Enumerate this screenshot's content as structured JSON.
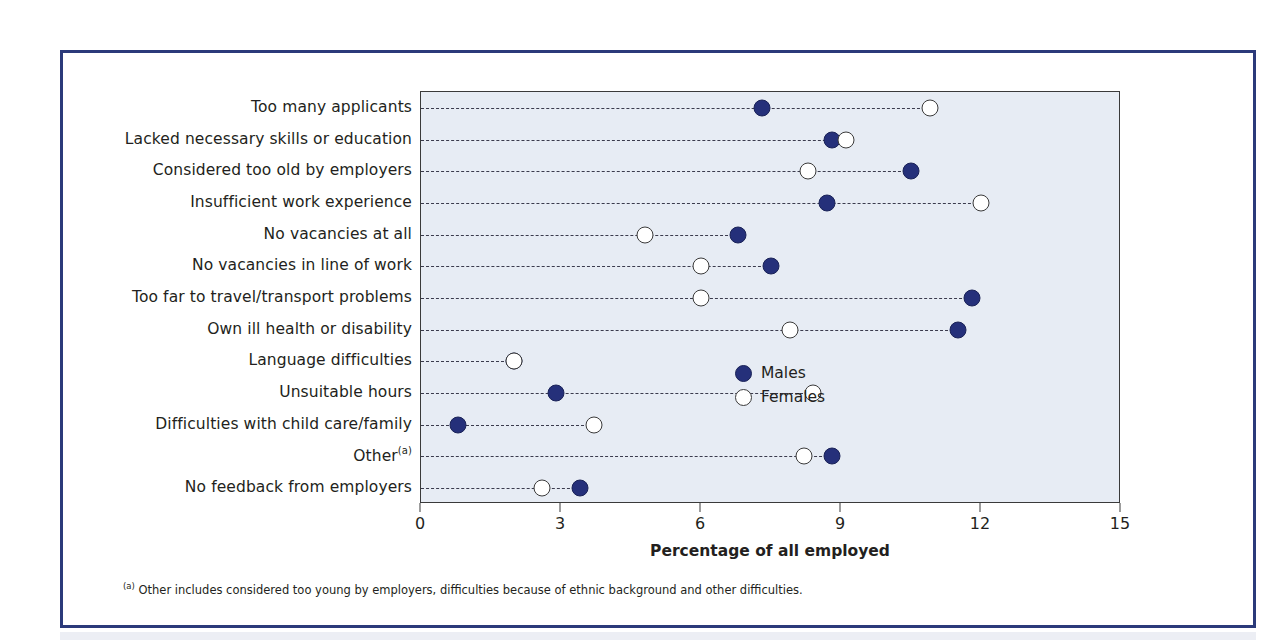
{
  "chart_data": {
    "type": "scatter",
    "title": "",
    "xlabel": "Percentage of all employed",
    "ylabel": "",
    "xlim": [
      0,
      15
    ],
    "xticks": [
      "0",
      "3",
      "6",
      "9",
      "12",
      "15"
    ],
    "grid": false,
    "legend_position": "inside-right",
    "categories": [
      "Too many applicants",
      "Lacked necessary skills or education",
      "Considered too old by employers",
      "Insufficient work experience",
      "No vacancies at all",
      "No vacancies in line of work",
      "Too far to travel/transport problems",
      "Own ill health or disability",
      "Language difficulties",
      "Unsuitable hours",
      "Difficulties with child care/family",
      "Other",
      "No feedback from employers"
    ],
    "category_footnote_marks": [
      "",
      "",
      "",
      "",
      "",
      "",
      "",
      "",
      "",
      "",
      "",
      "(a)",
      ""
    ],
    "series": [
      {
        "name": "Males",
        "color": "#25307a",
        "marker": "filled-circle",
        "values": [
          7.3,
          8.8,
          10.5,
          8.7,
          6.8,
          7.5,
          11.8,
          11.5,
          2.0,
          2.9,
          0.8,
          8.8,
          3.4
        ]
      },
      {
        "name": "Females",
        "color": "#ffffff",
        "marker": "open-circle",
        "values": [
          10.9,
          9.1,
          8.3,
          12.0,
          4.8,
          6.0,
          6.0,
          7.9,
          2.0,
          8.4,
          3.7,
          8.2,
          2.6
        ]
      }
    ]
  },
  "legend": {
    "entries": [
      {
        "label": "Males"
      },
      {
        "label": "Females"
      }
    ]
  },
  "footnote": {
    "mark": "(a)",
    "text": " Other includes considered too young by employers, difficulties because of ethnic background and other difficulties."
  },
  "colors": {
    "frame_border": "#2b3a7a",
    "plot_background": "#e7ecf4",
    "male_marker": "#25307a",
    "female_marker": "#ffffff",
    "axis": "#3a3a3a",
    "text": "#231f20"
  }
}
